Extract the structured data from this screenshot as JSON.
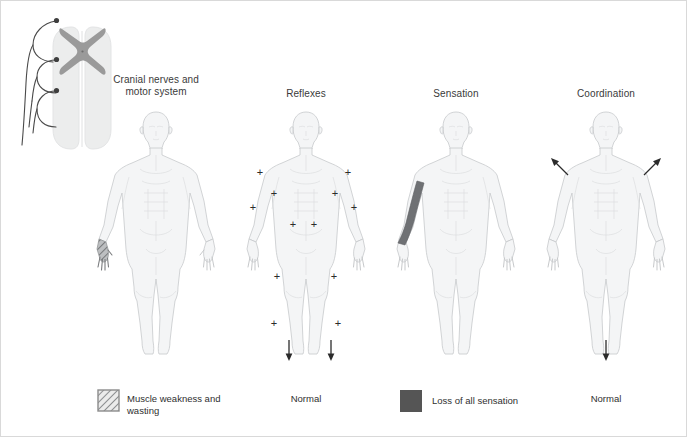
{
  "figure": {
    "type": "medical-examination-diagram",
    "panels": [
      {
        "id": "panel-cranial-motor",
        "title_line1": "Cranial nerves and",
        "title_line2": "motor system",
        "title_full": "Cranial nerves and motor system",
        "center_x": 155,
        "findings": [
          "muscle-weakness-and-wasting-left-hand"
        ],
        "legend_label": "Muscle weakness and wasting",
        "legend_swatch": "hatched-square",
        "legend_swatch_color": "#8c8c8c"
      },
      {
        "id": "panel-reflexes",
        "title_line1": "Reflexes",
        "title_line2": "",
        "title_full": "Reflexes",
        "center_x": 305,
        "findings": [
          "brisk-reflexes-plus-markers",
          "downgoing-plantars"
        ],
        "legend_label": "Normal",
        "legend_swatch": "none",
        "legend_swatch_color": ""
      },
      {
        "id": "panel-sensation",
        "title_line1": "Sensation",
        "title_line2": "",
        "title_full": "Sensation",
        "center_x": 455,
        "findings": [
          "loss-of-all-sensation-right-forearm"
        ],
        "legend_label": "Loss of all sensation",
        "legend_swatch": "solid-square",
        "legend_swatch_color": "#555555"
      },
      {
        "id": "panel-coordination",
        "title_line1": "Coordination",
        "title_line2": "",
        "title_full": "Coordination",
        "center_x": 605,
        "findings": [
          "normal-upper-limb-arrows",
          "normal-lower-limb-arrow"
        ],
        "legend_label": "Normal",
        "legend_swatch": "none",
        "legend_swatch_color": ""
      }
    ]
  },
  "spinal_diagram": {
    "name": "spinal-cord-cross-section",
    "description": "Spinal cord with butterfly grey matter and three nerve root loops",
    "grey_matter_color": "#9a9a9a",
    "cord_color": "#eceded",
    "nerve_color": "#4a4a4a",
    "nerve_root_count": 3
  },
  "reflex_markers": {
    "symbol": "+",
    "count": 10,
    "positions": [
      {
        "label": "left-shoulder",
        "x": 259,
        "y": 171
      },
      {
        "label": "right-shoulder",
        "x": 347,
        "y": 171
      },
      {
        "label": "left-elbow",
        "x": 273,
        "y": 192
      },
      {
        "label": "right-elbow",
        "x": 334,
        "y": 192
      },
      {
        "label": "left-wrist",
        "x": 252,
        "y": 206
      },
      {
        "label": "right-wrist",
        "x": 353,
        "y": 206
      },
      {
        "label": "left-hip",
        "x": 292,
        "y": 223
      },
      {
        "label": "right-hip",
        "x": 313,
        "y": 223
      },
      {
        "label": "left-knee",
        "x": 276,
        "y": 275
      },
      {
        "label": "right-knee",
        "x": 333,
        "y": 275
      },
      {
        "label": "left-ankle",
        "x": 273,
        "y": 322
      },
      {
        "label": "right-ankle",
        "x": 337,
        "y": 322
      }
    ]
  },
  "arrows": {
    "reflexes_plantar": [
      {
        "label": "left-plantar-down-arrow",
        "x": 288,
        "y": 344,
        "direction": "down"
      },
      {
        "label": "right-plantar-down-arrow",
        "x": 330,
        "y": 344,
        "direction": "down"
      }
    ],
    "coordination": [
      {
        "label": "left-upper-limb-arrow",
        "x": 556,
        "y": 160,
        "direction": "up-left"
      },
      {
        "label": "right-upper-limb-arrow",
        "x": 650,
        "y": 160,
        "direction": "up-right"
      },
      {
        "label": "lower-limb-arrow",
        "x": 605,
        "y": 344,
        "direction": "down"
      }
    ]
  },
  "legend": {
    "items": [
      {
        "swatch": "hatched-square",
        "label_line1": "Muscle weakness and",
        "label_line2": "wasting",
        "label": "Muscle weakness and wasting",
        "x": 100
      },
      {
        "swatch": "none",
        "label": "Normal",
        "x": 305
      },
      {
        "swatch": "solid-square",
        "label": "Loss of all sensation",
        "x": 400
      },
      {
        "swatch": "none",
        "label": "Normal",
        "x": 605
      }
    ]
  },
  "colors": {
    "body_outline": "#c7c9cb",
    "body_fill": "#f4f5f6",
    "body_detail": "#dcdee0",
    "sensation_loss": "#6f7174",
    "wasting_hatch": "#8d8f91",
    "text": "#2f2f2f",
    "frame_border": "#d9d9d9",
    "background": "#ffffff"
  }
}
